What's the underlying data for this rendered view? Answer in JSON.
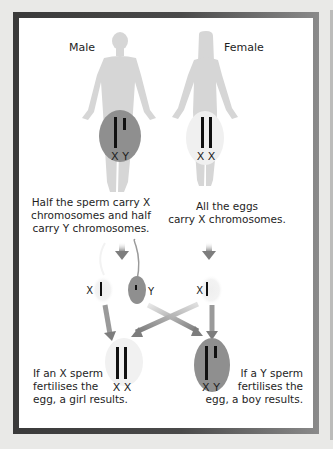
{
  "diagram": {
    "parents": {
      "male": {
        "label": "Male",
        "chromosomes": "X Y",
        "region_color": "#8f8f8f"
      },
      "female": {
        "label": "Female",
        "chromosomes": "X X",
        "region_color": "#f0f0f0"
      }
    },
    "captions": {
      "sperm": [
        "Half the sperm carry X",
        "chromosomes and half",
        "carry Y chromosomes."
      ],
      "eggs": [
        "All the eggs",
        "carry X chromosomes."
      ],
      "girl": [
        "If an X sperm",
        "fertilises the",
        "egg, a girl results."
      ],
      "boy": [
        "If a Y sperm",
        "fertilises the",
        "egg, a boy results."
      ]
    },
    "gametes": {
      "x_sperm": "X",
      "y_sperm": "Y",
      "egg": "X"
    },
    "offspring": {
      "girl": {
        "chromosomes": "X X"
      },
      "boy": {
        "chromosomes": "X Y"
      }
    },
    "colors": {
      "frame_dark": "#3a3a3a",
      "frame_light": "#8a8a8a",
      "body_silhouette": "#d6d6d6",
      "arrow": "#8a8a8a",
      "chromosome": "#111111",
      "background": "#e9e9e7"
    }
  }
}
